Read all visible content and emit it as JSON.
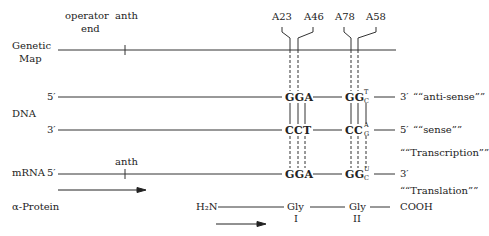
{
  "top_labels": {
    "operator": "operator",
    "end": "end",
    "anth": "anth"
  },
  "mutations": [
    {
      "label": "A23"
    },
    {
      "label": "A46"
    },
    {
      "label": "A78"
    },
    {
      "label": "A58"
    }
  ],
  "rows": {
    "genetic_map": {
      "line1": "Genetic",
      "line2": "Map"
    },
    "dna": {
      "label": "DNA",
      "strand_top": {
        "start": "5′",
        "end": "3′",
        "annotation": "““anti-sense””"
      },
      "strand_bottom": {
        "start": "3′",
        "end": "5′",
        "annotation": "““sense””"
      },
      "codon1_top": "GGA",
      "codon1_bottom": "CCT",
      "codon2_top": "GG",
      "codon2_top_sup": "T",
      "codon2_top_sub": "C",
      "codon2_bottom": "CC",
      "codon2_bottom_sup": "A",
      "codon2_bottom_sub": "G"
    },
    "transcription": "““Transcription””",
    "mrna": {
      "label": "mRNA",
      "start": "5′",
      "end": "3′",
      "tick_label": "anth",
      "codon1": "GGA",
      "codon2": "GG",
      "codon2_sup": "U",
      "codon2_sub": "C"
    },
    "translation": "““Translation””",
    "protein": {
      "label": "α-Protein",
      "n_term": "H₂N",
      "residue1": "Gly",
      "residue1_num": "I",
      "residue2": "Gly",
      "residue2_num": "II",
      "c_term": "COOH"
    }
  }
}
